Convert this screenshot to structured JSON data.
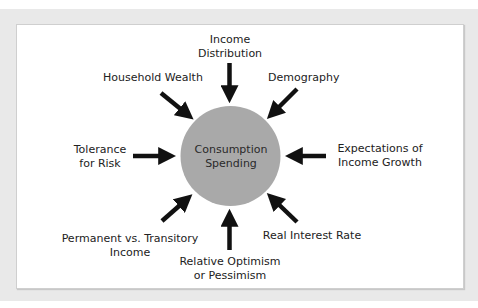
{
  "diagram": {
    "center": {
      "line1": "Consumption",
      "line2": "Spending",
      "color": "#a9a9a9"
    },
    "factors": [
      {
        "id": "income-distribution",
        "line1": "Income",
        "line2": "Distribution"
      },
      {
        "id": "demography",
        "line1": "Demography",
        "line2": ""
      },
      {
        "id": "expectations-income-growth",
        "line1": "Expectations of",
        "line2": "Income Growth"
      },
      {
        "id": "real-interest-rate",
        "line1": "Real Interest Rate",
        "line2": ""
      },
      {
        "id": "relative-optimism",
        "line1": "Relative Optimism",
        "line2": "or Pessimism"
      },
      {
        "id": "permanent-vs-transitory",
        "line1": "Permanent vs. Transitory",
        "line2": "Income"
      },
      {
        "id": "tolerance-for-risk",
        "line1": "Tolerance",
        "line2": "for Risk"
      },
      {
        "id": "household-wealth",
        "line1": "Household Wealth",
        "line2": ""
      }
    ],
    "colors": {
      "background": "#e9e9e9",
      "panel": "#ffffff",
      "arrow": "#111111"
    }
  }
}
